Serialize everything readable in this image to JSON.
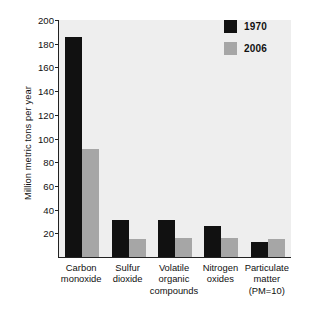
{
  "chart_data": {
    "type": "bar",
    "title": "",
    "xlabel": "",
    "ylabel": "Million metric tons per year",
    "ylim": [
      0,
      200
    ],
    "yticks": [
      20,
      40,
      60,
      80,
      100,
      120,
      140,
      160,
      180,
      200
    ],
    "ytick_labels": [
      "20",
      "40",
      "60",
      "80",
      "100",
      "120",
      "140",
      "160",
      "180",
      "200"
    ],
    "grid": false,
    "legend_position": "top-right",
    "categories": [
      "Carbon monoxide",
      "Sulfur dioxide",
      "Volatile organic compounds",
      "Nitrogen oxides",
      "Particulate matter (PM=10)"
    ],
    "category_lines": [
      [
        "Carbon",
        "monoxide"
      ],
      [
        "Sulfur",
        "dioxide"
      ],
      [
        "Volatile",
        "organic",
        "compounds"
      ],
      [
        "Nitrogen",
        "oxides"
      ],
      [
        "Particulate",
        "matter",
        "(PM=10)"
      ]
    ],
    "series": [
      {
        "name": "1970",
        "color": "#111111",
        "values": [
          186,
          31,
          31,
          26,
          13
        ]
      },
      {
        "name": "2006",
        "color": "#a6a6a6",
        "values": [
          91,
          15,
          16,
          16,
          15
        ]
      }
    ]
  },
  "legend": {
    "items": [
      {
        "label": "1970",
        "color": "#111111"
      },
      {
        "label": "2006",
        "color": "#a6a6a6"
      }
    ]
  },
  "axes": {
    "y_title": "Million metric tons per year"
  }
}
